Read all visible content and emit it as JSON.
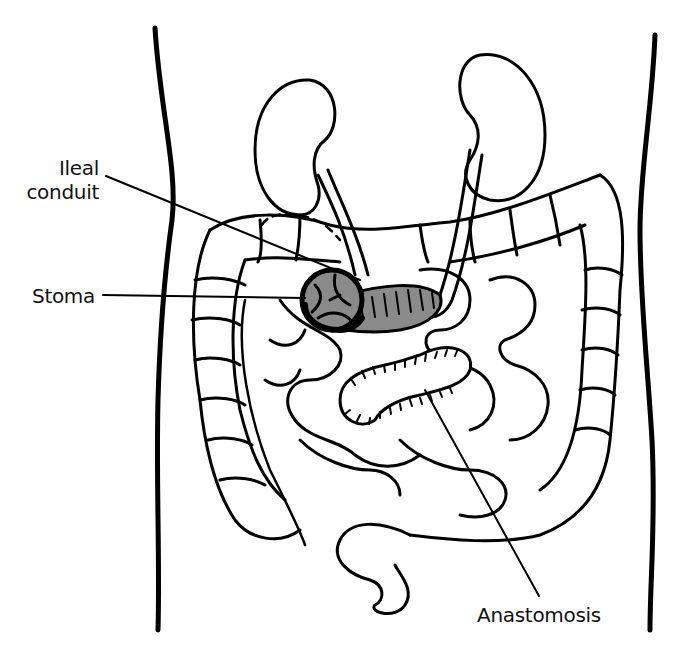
{
  "diagram": {
    "labels": [
      {
        "id": "ileal-conduit",
        "text_line1": "Ileal",
        "text_line2": "conduit"
      },
      {
        "id": "stoma",
        "text": "Stoma"
      },
      {
        "id": "anastomosis",
        "text": "Anastomosis"
      }
    ],
    "colors": {
      "line": "#000000",
      "background": "#ffffff",
      "conduit_fill": "#8a8a8a"
    }
  }
}
